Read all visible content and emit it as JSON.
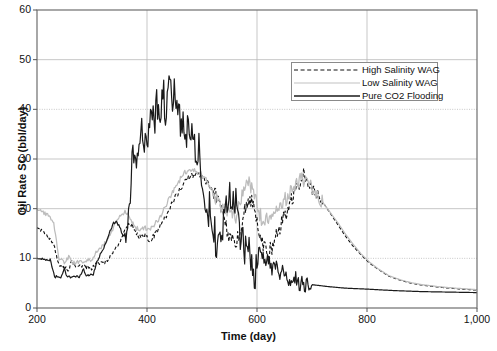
{
  "chart_data": {
    "type": "line",
    "title": "",
    "xlabel": "Time (day)",
    "ylabel": "Oil Rate SC (bbl/day)",
    "xlim": [
      200,
      1000
    ],
    "ylim": [
      0,
      60
    ],
    "xticks": [
      200,
      400,
      600,
      800,
      1000
    ],
    "xticklabels": [
      "200",
      "400",
      "600",
      "800",
      "1,000"
    ],
    "yticks": [
      0,
      10,
      20,
      30,
      40,
      50,
      60
    ],
    "yticklabels": [
      "0",
      "10",
      "20",
      "30",
      "40",
      "50",
      "60"
    ],
    "grid": true,
    "legend_position": "upper right",
    "series": [
      {
        "name": "High Salinity WAG",
        "style": "dashed",
        "color": "#111111",
        "x": [
          200,
          210,
          220,
          230,
          240,
          250,
          258,
          262,
          270,
          280,
          290,
          300,
          310,
          320,
          330,
          340,
          350,
          360,
          368,
          374,
          380,
          388,
          396,
          404,
          412,
          420,
          430,
          440,
          450,
          460,
          470,
          480,
          490,
          500,
          510,
          520,
          530,
          540,
          548,
          556,
          562,
          568,
          574,
          580,
          586,
          592,
          598,
          604,
          612,
          620,
          630,
          640,
          650,
          660,
          668,
          676,
          684,
          692,
          700,
          712,
          724,
          736,
          748,
          760,
          775,
          790,
          805,
          820,
          840,
          860,
          880,
          900,
          930,
          960,
          1000
        ],
        "y": [
          16.5,
          15.2,
          14.3,
          13.0,
          8.6,
          8.2,
          7.4,
          9.6,
          8.4,
          8.6,
          8.2,
          8.0,
          9.2,
          9.0,
          9.8,
          11.4,
          13.2,
          15.8,
          17.0,
          16.6,
          15.0,
          14.2,
          14.8,
          13.4,
          14.6,
          15.8,
          17.4,
          19.8,
          22.0,
          24.0,
          25.6,
          26.6,
          26.9,
          26.4,
          25.2,
          23.4,
          21.2,
          18.2,
          15.0,
          13.2,
          12.6,
          14.6,
          17.8,
          20.4,
          22.0,
          20.8,
          18.4,
          15.0,
          12.4,
          10.6,
          13.0,
          15.6,
          18.6,
          21.2,
          23.6,
          25.6,
          26.9,
          26.2,
          24.6,
          22.6,
          20.6,
          18.6,
          16.6,
          14.6,
          12.4,
          10.6,
          9.0,
          7.8,
          6.4,
          5.6,
          5.0,
          4.6,
          4.2,
          3.9,
          3.6
        ]
      },
      {
        "name": "Low Salinity WAG",
        "style": "solid-light",
        "color": "#b8b8b8",
        "x": [
          200,
          210,
          220,
          230,
          240,
          250,
          258,
          266,
          274,
          282,
          290,
          300,
          310,
          320,
          330,
          340,
          350,
          360,
          368,
          374,
          380,
          388,
          396,
          404,
          412,
          420,
          430,
          440,
          450,
          460,
          470,
          480,
          490,
          500,
          510,
          520,
          530,
          540,
          548,
          556,
          562,
          568,
          574,
          580,
          586,
          592,
          598,
          604,
          612,
          620,
          630,
          640,
          650,
          660,
          668,
          676,
          684,
          692,
          700,
          712,
          724,
          736,
          748,
          760,
          775,
          790,
          805,
          820,
          840,
          860,
          880,
          900,
          930,
          960,
          1000
        ],
        "y": [
          20.2,
          19.4,
          18.6,
          17.4,
          10.0,
          9.2,
          10.4,
          9.0,
          9.4,
          9.2,
          9.6,
          9.8,
          11.6,
          12.6,
          14.0,
          16.4,
          18.6,
          19.4,
          18.4,
          17.2,
          16.0,
          15.6,
          16.4,
          15.4,
          16.6,
          17.8,
          19.6,
          22.0,
          24.2,
          26.0,
          27.2,
          27.8,
          27.6,
          26.8,
          25.4,
          23.4,
          21.2,
          19.4,
          18.6,
          18.4,
          18.8,
          20.6,
          23.0,
          24.8,
          25.4,
          24.0,
          21.6,
          19.0,
          17.2,
          17.6,
          19.2,
          20.4,
          21.6,
          23.2,
          24.6,
          25.6,
          26.2,
          25.6,
          24.2,
          22.4,
          20.6,
          18.8,
          17.0,
          15.0,
          12.8,
          10.8,
          9.2,
          7.9,
          6.5,
          5.7,
          5.1,
          4.7,
          4.3,
          4.0,
          3.7
        ]
      },
      {
        "name": "Pure CO2 Flooding",
        "style": "solid",
        "color": "#1a1a1a",
        "x": [
          200,
          212,
          224,
          232,
          238,
          244,
          250,
          254,
          258,
          262,
          266,
          272,
          278,
          284,
          290,
          296,
          302,
          308,
          314,
          320,
          326,
          332,
          338,
          344,
          350,
          356,
          362,
          366,
          370,
          374,
          378,
          382,
          386,
          390,
          394,
          398,
          402,
          406,
          410,
          414,
          418,
          422,
          426,
          430,
          434,
          438,
          442,
          446,
          450,
          454,
          458,
          462,
          466,
          470,
          474,
          478,
          482,
          486,
          490,
          494,
          498,
          502,
          506,
          510,
          514,
          518,
          522,
          526,
          530,
          536,
          542,
          548,
          554,
          560,
          566,
          572,
          578,
          584,
          590,
          596,
          604,
          614,
          626,
          640,
          660,
          680,
          700,
          730,
          760,
          800,
          850,
          900,
          950,
          1000
        ],
        "y": [
          10.0,
          9.8,
          9.7,
          6.4,
          6.3,
          6.2,
          8.2,
          6.2,
          6.2,
          6.2,
          6.2,
          6.3,
          6.4,
          7.8,
          6.5,
          6.6,
          6.6,
          9.0,
          10.6,
          11.8,
          13.4,
          15.4,
          17.0,
          17.4,
          16.4,
          14.8,
          13.8,
          16.0,
          22.0,
          30.0,
          33.6,
          29.4,
          34.2,
          36.0,
          32.0,
          37.4,
          33.2,
          35.8,
          41.8,
          36.0,
          43.0,
          38.0,
          41.0,
          44.0,
          38.4,
          42.0,
          45.0,
          40.0,
          43.2,
          38.0,
          42.0,
          36.0,
          39.0,
          34.0,
          36.8,
          31.0,
          38.0,
          34.0,
          30.0,
          33.0,
          29.0,
          26.0,
          22.0,
          18.0,
          20.0,
          14.0,
          16.0,
          11.0,
          13.0,
          15.6,
          19.0,
          22.0,
          24.0,
          21.0,
          18.0,
          14.0,
          11.0,
          13.0,
          9.0,
          6.0,
          12.0,
          10.0,
          8.6,
          7.4,
          6.0,
          5.2,
          4.7,
          4.3,
          4.0,
          3.8,
          3.5,
          3.3,
          3.2,
          3.1
        ]
      }
    ]
  },
  "legend": {
    "items": [
      {
        "label": "High Salinity WAG"
      },
      {
        "label": "Low Salinity WAG"
      },
      {
        "label": "Pure CO2 Flooding"
      }
    ]
  },
  "axes": {
    "x_title": "Time (day)",
    "y_title": "Oil Rate SC (bbl/day)"
  }
}
